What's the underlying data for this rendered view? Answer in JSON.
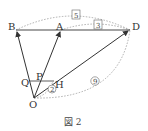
{
  "diagram": {
    "caption": "図 2",
    "points": {
      "B": {
        "label": "B",
        "x": 16,
        "y": 30
      },
      "A": {
        "label": "A",
        "x": 61,
        "y": 30
      },
      "D": {
        "label": "D",
        "x": 130,
        "y": 30
      },
      "O": {
        "label": "O",
        "x": 34,
        "y": 98
      },
      "Q": {
        "label": "Q",
        "x": 28,
        "y": 81
      },
      "P": {
        "label": "P",
        "x": 40,
        "y": 79
      },
      "H": {
        "label": "H",
        "x": 53,
        "y": 81
      }
    },
    "ratio_labels": {
      "BD_boxed": "5",
      "AD_boxed": "3",
      "OD_circled": "9",
      "OH_circled": "2"
    },
    "colors": {
      "line": "#333333",
      "dotted": "#999999"
    }
  }
}
